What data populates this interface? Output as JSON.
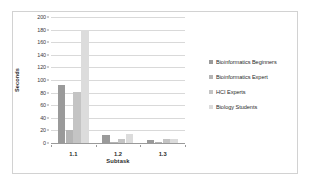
{
  "chart_data": {
    "type": "bar",
    "title": "",
    "xlabel": "Subtask",
    "ylabel": "Seconds",
    "categories": [
      "1.1",
      "1.2",
      "1.3"
    ],
    "ylim": [
      0,
      200
    ],
    "yticks": [
      0,
      20,
      40,
      60,
      80,
      100,
      120,
      140,
      160,
      180,
      200
    ],
    "grid": true,
    "legend_position": "right",
    "series": [
      {
        "name": "Bioinformatics Beginners",
        "color": "#9a9a9a",
        "values": [
          92,
          13,
          5
        ]
      },
      {
        "name": "Bioinformatics Expert",
        "color": "#b5b5b5",
        "values": [
          20,
          2,
          1
        ]
      },
      {
        "name": "HCI Experts",
        "color": "#c4c4c4",
        "values": [
          81,
          6,
          6
        ]
      },
      {
        "name": "Biology Students",
        "color": "#dcdcdc",
        "values": [
          180,
          14,
          7
        ]
      }
    ]
  }
}
